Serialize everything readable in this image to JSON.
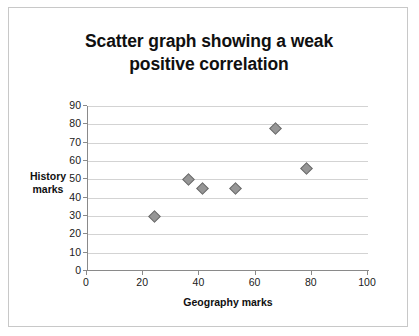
{
  "chart_data": {
    "type": "scatter",
    "title": "Scatter graph showing a weak positive correlation",
    "title_line1": "Scatter graph showing a weak",
    "title_line2": "positive correlation",
    "xlabel": "Geography marks",
    "ylabel": "History marks",
    "ylabel_line1": "History",
    "ylabel_line2": "marks",
    "xlim": [
      0,
      100
    ],
    "ylim": [
      0,
      90
    ],
    "xticks": [
      0,
      20,
      40,
      60,
      80,
      100
    ],
    "yticks": [
      0,
      10,
      20,
      30,
      40,
      50,
      60,
      70,
      80,
      90
    ],
    "grid": "horizontal",
    "legend": "none",
    "marker": "diamond",
    "marker_color": "#969696",
    "points": [
      {
        "x": 24,
        "y": 30
      },
      {
        "x": 36,
        "y": 50
      },
      {
        "x": 41,
        "y": 45
      },
      {
        "x": 53,
        "y": 45
      },
      {
        "x": 67,
        "y": 78
      },
      {
        "x": 78,
        "y": 56
      }
    ]
  }
}
